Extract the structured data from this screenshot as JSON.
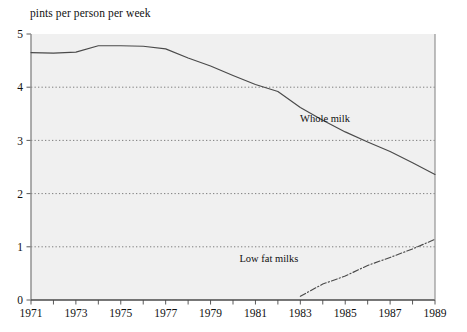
{
  "chart_data": {
    "type": "line",
    "title": "pints per person per week",
    "xlabel": "",
    "ylabel": "pints per person per week",
    "xlim": [
      1971,
      1989
    ],
    "ylim": [
      0,
      5
    ],
    "grid": true,
    "grid_values": [
      1,
      2,
      3,
      4
    ],
    "legend_position": "inline-annotations",
    "x": [
      1971,
      1972,
      1973,
      1974,
      1975,
      1976,
      1977,
      1978,
      1979,
      1980,
      1981,
      1982,
      1983,
      1984,
      1985,
      1986,
      1987,
      1988,
      1989
    ],
    "xticks": [
      1971,
      1972,
      1973,
      1974,
      1975,
      1976,
      1977,
      1978,
      1979,
      1980,
      1981,
      1982,
      1983,
      1984,
      1985,
      1986,
      1987,
      1988,
      1989
    ],
    "xtick_labels": [
      "1971",
      "",
      "1973",
      "",
      "1975",
      "",
      "1977",
      "",
      "1979",
      "",
      "1981",
      "",
      "1983",
      "",
      "1985",
      "",
      "1987",
      "",
      "1989"
    ],
    "yticks": [
      0,
      1,
      2,
      3,
      4,
      5
    ],
    "ytick_labels": [
      "0",
      "1",
      "2",
      "3",
      "4",
      "5"
    ],
    "series": [
      {
        "name": "Whole milk",
        "style": "solid",
        "color": "#4a4a4a",
        "label_x": 1984.1,
        "label_y": 3.35,
        "x": [
          1971,
          1972,
          1973,
          1974,
          1975,
          1976,
          1977,
          1978,
          1979,
          1980,
          1981,
          1982,
          1983,
          1984,
          1985,
          1986,
          1987,
          1988,
          1989
        ],
        "values": [
          4.65,
          4.64,
          4.66,
          4.78,
          4.78,
          4.77,
          4.72,
          4.55,
          4.4,
          4.22,
          4.05,
          3.92,
          3.62,
          3.38,
          3.16,
          2.97,
          2.79,
          2.58,
          2.36
        ]
      },
      {
        "name": "Low fat milks",
        "style": "dash-dot",
        "color": "#4a4a4a",
        "label_x": 1981.6,
        "label_y": 0.72,
        "x": [
          1983,
          1984,
          1985,
          1986,
          1987,
          1988,
          1989
        ],
        "values": [
          0.07,
          0.3,
          0.45,
          0.65,
          0.8,
          0.96,
          1.14
        ]
      }
    ]
  },
  "plot_geometry": {
    "left": 31,
    "right": 435,
    "top": 34,
    "bottom": 300,
    "bg_color": "#f0f0f0",
    "axis_color": "#8a8a8a",
    "grid_color": "#7d7d7d"
  }
}
